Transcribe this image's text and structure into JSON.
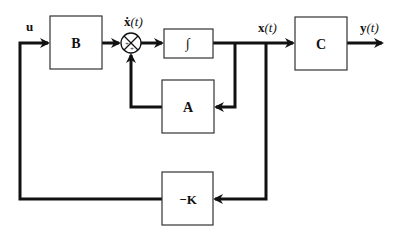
{
  "diagram": {
    "type": "state-feedback block diagram",
    "colors": {
      "line": "#111111",
      "block_border": "#333333",
      "background": "#ffffff"
    },
    "blocks": [
      {
        "id": "B",
        "label": "B"
      },
      {
        "id": "integrator",
        "label": "∫"
      },
      {
        "id": "A",
        "label": "A"
      },
      {
        "id": "C",
        "label": "C"
      },
      {
        "id": "K",
        "label": "−K"
      }
    ],
    "summing_junction": {
      "signs": [
        "+",
        "+"
      ]
    },
    "signals": {
      "input": "u",
      "state_derivative": {
        "main": "ẋ",
        "arg": "(t)"
      },
      "state": {
        "main": "x",
        "arg": "(t)"
      },
      "output": {
        "main": "y",
        "arg": "(t)"
      }
    }
  }
}
